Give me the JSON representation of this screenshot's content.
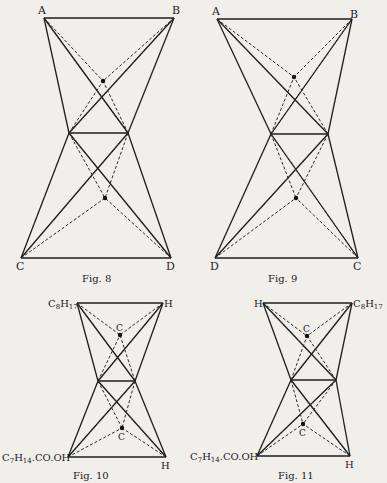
{
  "figures": [
    {
      "id": "fig8",
      "caption": "Fig. 8",
      "vertices": {
        "top_left": "A",
        "top_right": "B",
        "bottom_left": "C",
        "bottom_right": "D"
      },
      "points": {
        "tl": [
          44,
          18
        ],
        "tr": [
          174,
          18
        ],
        "ml": [
          69,
          133
        ],
        "mr": [
          128,
          133
        ],
        "bl": [
          21,
          258
        ],
        "br": [
          171,
          258
        ],
        "up": [
          103,
          81
        ],
        "lo": [
          105,
          198
        ]
      },
      "center_labels": {
        "upper": "",
        "lower": ""
      },
      "caption_pos": [
        100,
        278
      ]
    },
    {
      "id": "fig9",
      "caption": "Fig. 9",
      "vertices": {
        "top_left": "A",
        "top_right": "B",
        "bottom_left": "D",
        "bottom_right": "C"
      },
      "points": {
        "tl": [
          217,
          19
        ],
        "tr": [
          352,
          19
        ],
        "ml": [
          271,
          134
        ],
        "mr": [
          328,
          134
        ],
        "bl": [
          215,
          258
        ],
        "br": [
          358,
          258
        ],
        "up": [
          294,
          77
        ],
        "lo": [
          296,
          198
        ]
      },
      "center_labels": {
        "upper": "",
        "lower": ""
      },
      "caption_pos": [
        272,
        278
      ]
    },
    {
      "id": "fig10",
      "caption": "Fig. 10",
      "vertices": {
        "top_left": "C8H17",
        "top_right": "H",
        "bottom_left": "C7H14.CO.OH",
        "bottom_right": "H"
      },
      "points": {
        "tl": [
          77,
          303
        ],
        "tr": [
          163,
          303
        ],
        "ml": [
          98,
          381
        ],
        "mr": [
          135,
          381
        ],
        "bl": [
          68,
          457
        ],
        "br": [
          166,
          457
        ],
        "up": [
          120,
          335
        ],
        "lo": [
          122,
          428
        ]
      },
      "center_labels": {
        "upper": "C",
        "lower": "C"
      },
      "caption_pos": [
        90,
        474
      ]
    },
    {
      "id": "fig11",
      "caption": "Fig. 11",
      "vertices": {
        "top_left": "H",
        "top_right": "C8H17",
        "bottom_left": "C7H14.CO.OH",
        "bottom_right": "H"
      },
      "points": {
        "tl": [
          263,
          303
        ],
        "tr": [
          352,
          303
        ],
        "ml": [
          291,
          380
        ],
        "mr": [
          336,
          380
        ],
        "bl": [
          257,
          456
        ],
        "br": [
          350,
          456
        ],
        "up": [
          307,
          336
        ],
        "lo": [
          303,
          424
        ]
      },
      "center_labels": {
        "upper": "C",
        "lower": "C"
      },
      "caption_pos": [
        290,
        474
      ]
    }
  ],
  "labels": {
    "fig8": {
      "A": "A",
      "B": "B",
      "C": "C",
      "D": "D",
      "caption": "Fig. 8"
    },
    "fig9": {
      "A": "A",
      "B": "B",
      "D": "D",
      "C": "C",
      "caption": "Fig. 9"
    },
    "fig10": {
      "tl_main": "C",
      "tl_sub1": "8",
      "tl_main2": "H",
      "tl_sub2": "17",
      "tr": "H",
      "bl_c": "C",
      "bl_sub1": "7",
      "bl_h": "H",
      "bl_sub2": "14",
      "bl_rest": ".CO.OH",
      "br": "H",
      "upper_c": "C",
      "lower_c": "C",
      "caption": "Fig. 10"
    },
    "fig11": {
      "tl": "H",
      "tr_main": "C",
      "tr_sub1": "8",
      "tr_main2": "H",
      "tr_sub2": "17",
      "bl_c": "C",
      "bl_sub1": "7",
      "bl_h": "H",
      "bl_sub2": "14",
      "bl_rest": ".CO.OH",
      "br": "H",
      "upper_c": "C",
      "lower_c": "C",
      "caption": "Fig. 11"
    }
  },
  "colors": {
    "background": "#f1efea",
    "ink": "#1e1e1e"
  }
}
